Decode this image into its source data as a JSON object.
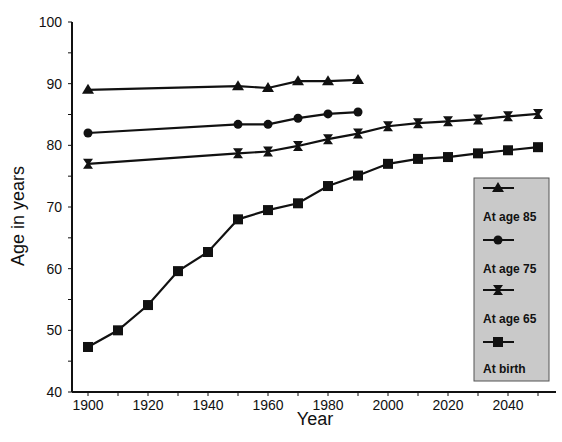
{
  "chart_data": {
    "type": "line",
    "title": "",
    "xlabel": "Year",
    "ylabel": "Age in years",
    "xlim": [
      1895,
      2055
    ],
    "ylim": [
      40,
      100
    ],
    "x_ticks": [
      1900,
      1920,
      1940,
      1960,
      1980,
      2000,
      2020,
      2040
    ],
    "y_ticks": [
      40,
      50,
      60,
      70,
      80,
      90,
      100
    ],
    "grid": false,
    "legend_position": "right-inside",
    "series": [
      {
        "name": "At age 85",
        "marker": "triangle",
        "x": [
          1900,
          1950,
          1960,
          1970,
          1980,
          1990
        ],
        "values": [
          89.0,
          89.6,
          89.3,
          90.4,
          90.4,
          90.6
        ]
      },
      {
        "name": "At age 75",
        "marker": "circle",
        "x": [
          1900,
          1950,
          1960,
          1970,
          1980,
          1990
        ],
        "values": [
          82.0,
          83.4,
          83.4,
          84.4,
          85.1,
          85.4
        ]
      },
      {
        "name": "At age 65",
        "marker": "hourglass",
        "x": [
          1900,
          1950,
          1960,
          1970,
          1980,
          1990,
          2000,
          2010,
          2020,
          2030,
          2040,
          2050
        ],
        "values": [
          77.0,
          78.7,
          79.0,
          79.9,
          81.0,
          81.9,
          83.1,
          83.6,
          83.9,
          84.2,
          84.7,
          85.1
        ]
      },
      {
        "name": "At birth",
        "marker": "square",
        "x": [
          1900,
          1910,
          1920,
          1930,
          1940,
          1950,
          1960,
          1970,
          1980,
          1990,
          2000,
          2010,
          2020,
          2030,
          2040,
          2050
        ],
        "values": [
          47.3,
          50.0,
          54.1,
          59.6,
          62.7,
          68.0,
          69.5,
          70.6,
          73.4,
          75.1,
          77.0,
          77.8,
          78.1,
          78.7,
          79.2,
          79.7
        ]
      }
    ]
  },
  "colors": {
    "line": "#111111",
    "legend_bg": "#c9c9c9",
    "legend_border": "#555555"
  }
}
